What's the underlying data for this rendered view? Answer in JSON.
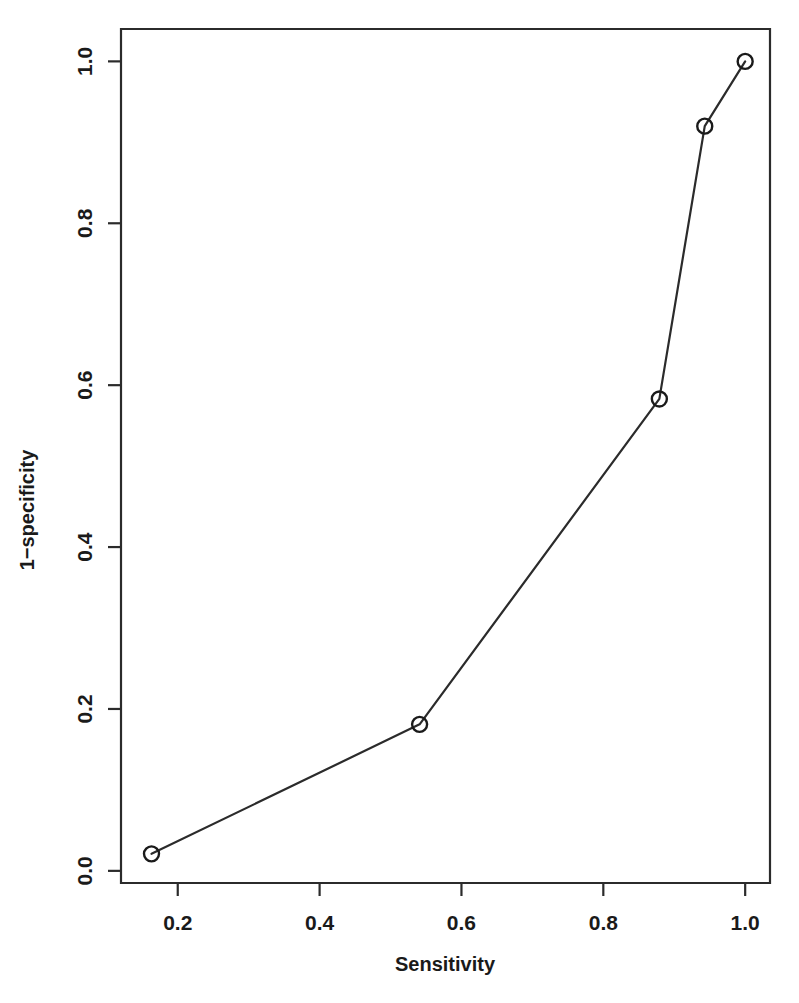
{
  "chart_data": {
    "type": "line",
    "title": "",
    "subtitle": "",
    "xlabel": "Sensitivity",
    "ylabel": "1−specificity",
    "xlim": [
      0.12,
      1.035
    ],
    "ylim": [
      -0.015,
      1.04
    ],
    "xticks": [
      0.2,
      0.4,
      0.6,
      0.8,
      1.0
    ],
    "xtick_labels": [
      "0.2",
      "0.4",
      "0.6",
      "0.8",
      "1.0"
    ],
    "yticks": [
      0.0,
      0.2,
      0.4,
      0.6,
      0.8,
      1.0
    ],
    "ytick_labels": [
      "0.0",
      "0.2",
      "0.4",
      "0.6",
      "0.8",
      "1.0"
    ],
    "grid": false,
    "legend": null,
    "marker": "circle-open",
    "line_color": "#2b2b2b",
    "marker_color": "#1a1a1a",
    "background": "#ffffff",
    "series": [
      {
        "name": "ROC",
        "x": [
          0.163,
          0.541,
          0.879,
          0.943,
          1.0
        ],
        "y": [
          0.021,
          0.181,
          0.583,
          0.92,
          1.0
        ]
      }
    ],
    "points": [
      {
        "x": 0.163,
        "y": 0.021
      },
      {
        "x": 0.541,
        "y": 0.181
      },
      {
        "x": 0.879,
        "y": 0.583
      },
      {
        "x": 0.943,
        "y": 0.92
      },
      {
        "x": 1.0,
        "y": 1.0
      }
    ]
  },
  "figure": {
    "plot_box": {
      "left": 121,
      "top": 29,
      "right": 770,
      "bottom": 883
    },
    "axis_color": "#2b2b2b"
  }
}
